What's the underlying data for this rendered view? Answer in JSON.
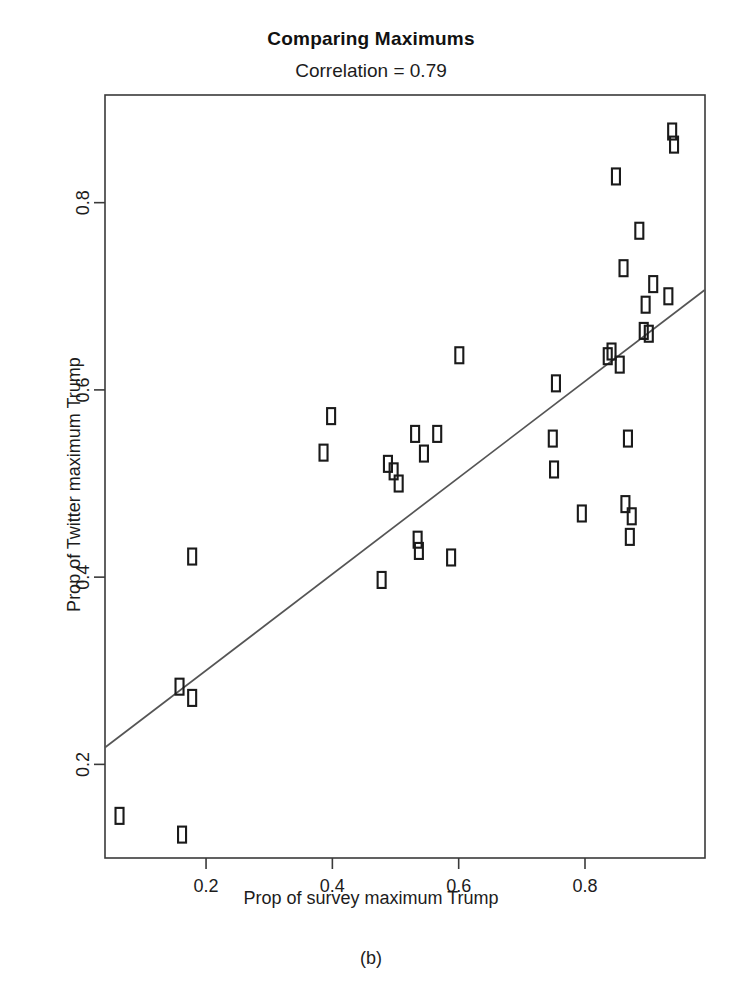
{
  "chart_data": {
    "type": "scatter",
    "title": "Comparing Maximums",
    "subtitle": "Correlation = 0.79",
    "caption": "(b)",
    "xlabel": "Prop of survey maximum Trump",
    "ylabel": "Prop of Twitter maximum Trump",
    "grid": false,
    "legend": "none",
    "marker": "open-rectangle",
    "marker_color": "#1a1a1a",
    "line_color": "#555555",
    "xlim": [
      0.04,
      0.99
    ],
    "ylim": [
      0.1,
      0.915
    ],
    "xticks": [
      0.2,
      0.4,
      0.6,
      0.8
    ],
    "xtick_labels": [
      "0.2",
      "0.4",
      "0.6",
      "0.8"
    ],
    "yticks": [
      0.2,
      0.4,
      0.6,
      0.8
    ],
    "ytick_labels": [
      "0.2",
      "0.4",
      "0.6",
      "0.8"
    ],
    "trend_line": {
      "type": "linear-fit",
      "x": [
        0.04,
        0.99
      ],
      "y": [
        0.218,
        0.707
      ]
    },
    "points": [
      {
        "x": 0.063,
        "y": 0.145
      },
      {
        "x": 0.162,
        "y": 0.125
      },
      {
        "x": 0.158,
        "y": 0.283
      },
      {
        "x": 0.178,
        "y": 0.271
      },
      {
        "x": 0.178,
        "y": 0.422
      },
      {
        "x": 0.386,
        "y": 0.533
      },
      {
        "x": 0.398,
        "y": 0.572
      },
      {
        "x": 0.478,
        "y": 0.397
      },
      {
        "x": 0.488,
        "y": 0.521
      },
      {
        "x": 0.497,
        "y": 0.513
      },
      {
        "x": 0.505,
        "y": 0.5
      },
      {
        "x": 0.531,
        "y": 0.553
      },
      {
        "x": 0.535,
        "y": 0.44
      },
      {
        "x": 0.537,
        "y": 0.428
      },
      {
        "x": 0.545,
        "y": 0.532
      },
      {
        "x": 0.566,
        "y": 0.553
      },
      {
        "x": 0.588,
        "y": 0.421
      },
      {
        "x": 0.601,
        "y": 0.637
      },
      {
        "x": 0.749,
        "y": 0.548
      },
      {
        "x": 0.751,
        "y": 0.515
      },
      {
        "x": 0.754,
        "y": 0.607
      },
      {
        "x": 0.795,
        "y": 0.468
      },
      {
        "x": 0.836,
        "y": 0.636
      },
      {
        "x": 0.842,
        "y": 0.641
      },
      {
        "x": 0.849,
        "y": 0.828
      },
      {
        "x": 0.855,
        "y": 0.627
      },
      {
        "x": 0.861,
        "y": 0.73
      },
      {
        "x": 0.864,
        "y": 0.478
      },
      {
        "x": 0.868,
        "y": 0.548
      },
      {
        "x": 0.871,
        "y": 0.443
      },
      {
        "x": 0.874,
        "y": 0.465
      },
      {
        "x": 0.886,
        "y": 0.77
      },
      {
        "x": 0.893,
        "y": 0.663
      },
      {
        "x": 0.896,
        "y": 0.691
      },
      {
        "x": 0.901,
        "y": 0.66
      },
      {
        "x": 0.908,
        "y": 0.713
      },
      {
        "x": 0.932,
        "y": 0.7
      },
      {
        "x": 0.938,
        "y": 0.876
      },
      {
        "x": 0.941,
        "y": 0.862
      }
    ]
  }
}
